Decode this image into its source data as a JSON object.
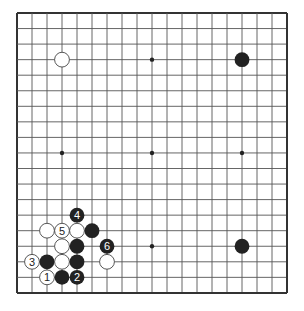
{
  "diagram": {
    "title": "",
    "board": {
      "size": 19,
      "origin_x": 17,
      "origin_y": 13,
      "spacing_x": 15,
      "spacing_y": 15.55,
      "line_color": "#555555",
      "edge_color": "#333333",
      "hoshi": [
        [
          3,
          3
        ],
        [
          9,
          3
        ],
        [
          15,
          3
        ],
        [
          3,
          9
        ],
        [
          9,
          9
        ],
        [
          15,
          9
        ],
        [
          3,
          15
        ],
        [
          9,
          15
        ],
        [
          15,
          15
        ]
      ]
    },
    "colors": {
      "black_stone": "#222222",
      "white_stone": "#ffffff",
      "white_stone_border": "#444444",
      "label_on_black": "#ffffff",
      "label_on_white": "#222222"
    },
    "stones": [
      {
        "color": "white",
        "col": 3,
        "row": 3,
        "label": ""
      },
      {
        "color": "black",
        "col": 15,
        "row": 3,
        "label": ""
      },
      {
        "color": "black",
        "col": 15,
        "row": 15,
        "label": ""
      },
      {
        "color": "black",
        "col": 4,
        "row": 13,
        "label": "4"
      },
      {
        "color": "white",
        "col": 2,
        "row": 14,
        "label": ""
      },
      {
        "color": "white",
        "col": 3,
        "row": 14,
        "label": "5"
      },
      {
        "color": "white",
        "col": 4,
        "row": 14,
        "label": ""
      },
      {
        "color": "black",
        "col": 5,
        "row": 14,
        "label": ""
      },
      {
        "color": "white",
        "col": 3,
        "row": 15,
        "label": ""
      },
      {
        "color": "black",
        "col": 4,
        "row": 15,
        "label": ""
      },
      {
        "color": "black",
        "col": 6,
        "row": 15,
        "label": "6"
      },
      {
        "color": "white",
        "col": 1,
        "row": 16,
        "label": "3"
      },
      {
        "color": "black",
        "col": 2,
        "row": 16,
        "label": ""
      },
      {
        "color": "white",
        "col": 3,
        "row": 16,
        "label": ""
      },
      {
        "color": "black",
        "col": 4,
        "row": 16,
        "label": ""
      },
      {
        "color": "white",
        "col": 6,
        "row": 16,
        "label": ""
      },
      {
        "color": "white",
        "col": 2,
        "row": 17,
        "label": "1"
      },
      {
        "color": "black",
        "col": 3,
        "row": 17,
        "label": ""
      },
      {
        "color": "black",
        "col": 4,
        "row": 17,
        "label": "2"
      }
    ]
  }
}
